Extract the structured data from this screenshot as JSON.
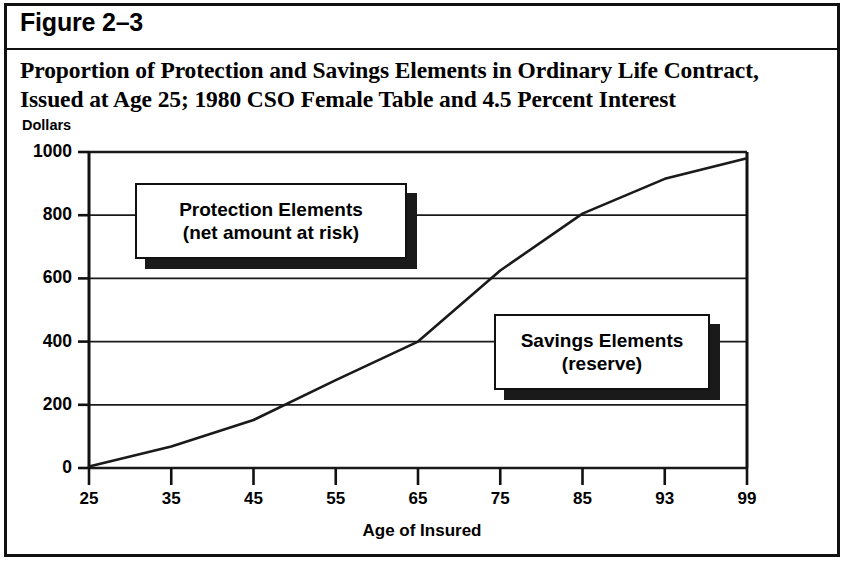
{
  "figure": {
    "label": "Figure 2–3",
    "title_line_1": "Proportion of Protection and Savings Elements in Ordinary Life Contract,",
    "title_line_2": "Issued at Age 25; 1980 CSO Female Table and 4.5 Percent Interest"
  },
  "callouts": {
    "protection": {
      "line1": "Protection Elements",
      "line2": "(net amount at risk)"
    },
    "savings": {
      "line1": "Savings Elements",
      "line2": "(reserve)"
    }
  },
  "colors": {
    "line": "#1a1a1a",
    "grid": "#1a1a1a",
    "axis": "#111111",
    "background": "#ffffff",
    "shadow": "#1a1a1a"
  },
  "chart_data": {
    "type": "line",
    "title": "Proportion of Protection and Savings Elements in Ordinary Life Contract, Issued at Age 25; 1980 CSO Female Table and 4.5 Percent Interest",
    "xlabel": "Age of Insured",
    "ylabel": "Dollars",
    "ylim": [
      0,
      1000
    ],
    "yticks": [
      0,
      200,
      400,
      600,
      800,
      1000
    ],
    "ytick_labels": [
      "0",
      "200",
      "400",
      "600",
      "800",
      "1000"
    ],
    "xticks": [
      25,
      35,
      45,
      55,
      65,
      75,
      85,
      93,
      99
    ],
    "xtick_labels": [
      "25",
      "35",
      "45",
      "55",
      "65",
      "75",
      "85",
      "93",
      "99"
    ],
    "grid": true,
    "legend": "none",
    "series": [
      {
        "name": "Reserve (savings element)",
        "x": [
          25,
          35,
          45,
          55,
          65,
          75,
          85,
          93,
          99
        ],
        "values": [
          5,
          68,
          152,
          278,
          400,
          625,
          805,
          915,
          980
        ]
      }
    ],
    "annotations": [
      "Protection Elements (net amount at risk)",
      "Savings Elements (reserve)"
    ]
  }
}
